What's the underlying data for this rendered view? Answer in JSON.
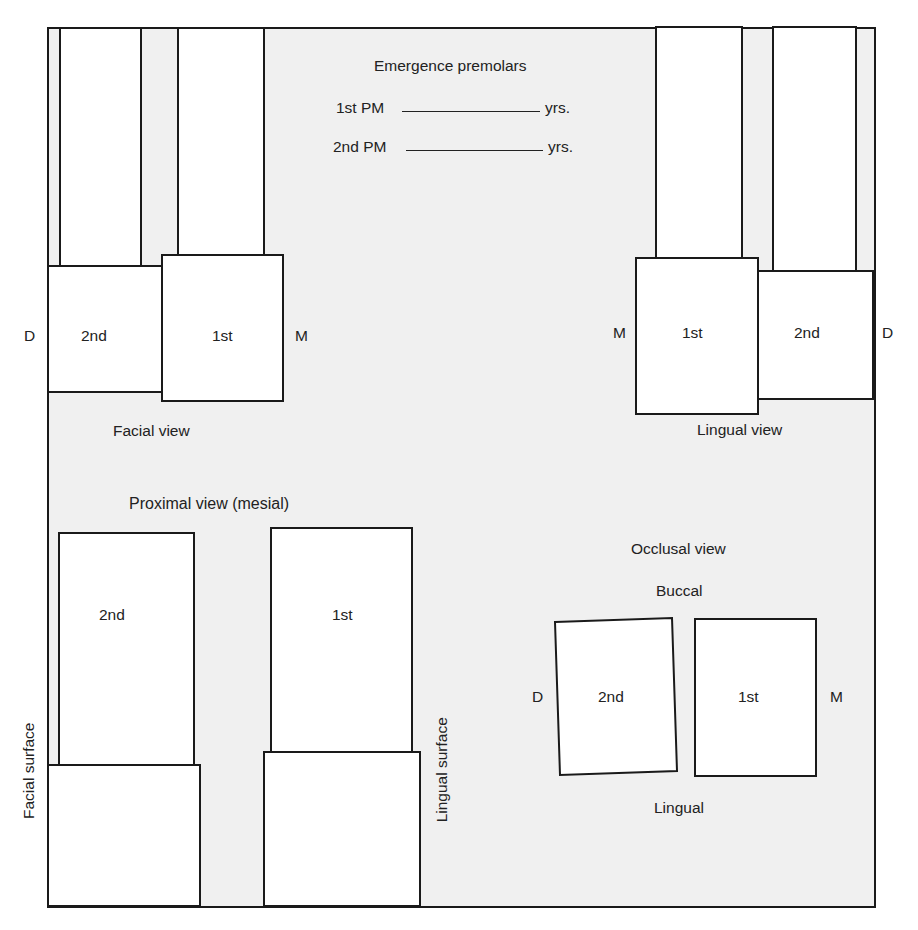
{
  "header": {
    "title": "Emergence premolars",
    "rows": [
      {
        "label": "1st PM",
        "value": "",
        "unit": "yrs."
      },
      {
        "label": "2nd PM",
        "value": "",
        "unit": "yrs."
      }
    ]
  },
  "facial_view": {
    "caption": "Facial view",
    "left_marker": "D",
    "right_marker": "M",
    "teeth": [
      {
        "label": "2nd"
      },
      {
        "label": "1st"
      }
    ]
  },
  "lingual_view": {
    "caption": "Lingual view",
    "left_marker": "M",
    "right_marker": "D",
    "teeth": [
      {
        "label": "1st"
      },
      {
        "label": "2nd"
      }
    ]
  },
  "proximal_view": {
    "caption": "Proximal view (mesial)",
    "left_side_label": "Facial surface",
    "right_side_label": "Lingual surface",
    "teeth": [
      {
        "label": "2nd"
      },
      {
        "label": "1st"
      }
    ]
  },
  "occlusal_view": {
    "caption": "Occlusal view",
    "top_label": "Buccal",
    "bottom_label": "Lingual",
    "left_marker": "D",
    "right_marker": "M",
    "teeth": [
      {
        "label": "2nd"
      },
      {
        "label": "1st"
      }
    ]
  },
  "colors": {
    "paper": "#f0f0f0",
    "tooth_fill": "#ffffff",
    "outline": "#1a1a1a",
    "text": "#222222"
  }
}
